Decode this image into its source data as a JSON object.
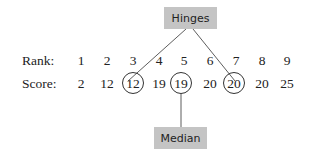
{
  "hinges_label": "Hinges",
  "median_label": "Median",
  "rank_label": "Rank:",
  "score_label": "Score:",
  "ranks": [
    "1",
    "2",
    "3",
    "4",
    "5",
    "6",
    "7",
    "8",
    "9"
  ],
  "scores": [
    "2",
    "12",
    "12",
    "19",
    "19",
    "20",
    "20",
    "20",
    "25"
  ],
  "circled_indices": [
    2,
    4,
    6
  ],
  "colors": {
    "box_fill": "#c4c4c4",
    "line": "#333333"
  }
}
